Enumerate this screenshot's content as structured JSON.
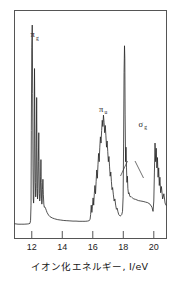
{
  "figure": {
    "xaxis_title": "イオン化エネルギー, I/eV",
    "frame_color": "#555555",
    "trace_color": "#262626"
  },
  "ticks": [
    {
      "label": "12",
      "value": 12
    },
    {
      "label": "14",
      "value": 14
    },
    {
      "label": "16",
      "value": 16
    },
    {
      "label": "18",
      "value": 18
    },
    {
      "label": "20",
      "value": 20
    }
  ],
  "annotations": [
    {
      "base": "π",
      "sub": "g",
      "x": 12.05,
      "y": 0.93
    },
    {
      "base": "π",
      "sub": "u",
      "x": 16.55,
      "y": 0.57
    },
    {
      "base": "σ",
      "sub": "g",
      "x": 19.15,
      "y": 0.5
    }
  ],
  "chart_data": {
    "type": "line",
    "title": "",
    "xlabel": "イオン化エネルギー, I/eV",
    "ylabel": "",
    "xlim": [
      10.9,
      20.8
    ],
    "ylim": [
      0,
      1
    ],
    "grid": false,
    "legend": "none",
    "tick_labels": [
      "12",
      "14",
      "16",
      "18",
      "20"
    ],
    "tick_values": [
      12,
      14,
      16,
      18,
      20
    ],
    "bands": [
      {
        "name": "πg",
        "label": "π_g",
        "onset": 11.95,
        "peak": 12.1,
        "range": [
          11.9,
          13.2
        ]
      },
      {
        "name": "πu",
        "label": "π_u",
        "onset": 15.85,
        "peak": 16.72,
        "range": [
          15.8,
          17.9
        ]
      },
      {
        "name": "σg",
        "label": "σ_g",
        "onset": 18.0,
        "peak": 18.12,
        "range": [
          18.0,
          20.6
        ]
      }
    ],
    "x": [
      10.9,
      11.1,
      11.3,
      11.5,
      11.7,
      11.8,
      11.88,
      11.92,
      11.95,
      11.97,
      12.0,
      12.03,
      12.06,
      12.08,
      12.1,
      12.12,
      12.14,
      12.16,
      12.18,
      12.2,
      12.23,
      12.26,
      12.28,
      12.3,
      12.32,
      12.34,
      12.36,
      12.38,
      12.4,
      12.43,
      12.46,
      12.48,
      12.5,
      12.52,
      12.55,
      12.58,
      12.6,
      12.62,
      12.64,
      12.66,
      12.68,
      12.7,
      12.73,
      12.76,
      12.79,
      12.82,
      12.85,
      12.9,
      12.95,
      13.0,
      13.1,
      13.2,
      13.35,
      13.5,
      13.7,
      13.9,
      14.1,
      14.3,
      14.5,
      14.7,
      14.9,
      15.1,
      15.3,
      15.5,
      15.65,
      15.75,
      15.82,
      15.86,
      15.9,
      15.94,
      15.98,
      16.02,
      16.06,
      16.1,
      16.14,
      16.18,
      16.22,
      16.26,
      16.3,
      16.34,
      16.38,
      16.42,
      16.46,
      16.5,
      16.54,
      16.58,
      16.62,
      16.66,
      16.7,
      16.74,
      16.78,
      16.82,
      16.86,
      16.9,
      16.94,
      16.98,
      17.02,
      17.06,
      17.1,
      17.14,
      17.18,
      17.22,
      17.26,
      17.3,
      17.35,
      17.4,
      17.45,
      17.5,
      17.55,
      17.6,
      17.65,
      17.7,
      17.75,
      17.8,
      17.85,
      17.9,
      17.95,
      17.99,
      18.02,
      18.05,
      18.08,
      18.1,
      18.12,
      18.15,
      18.18,
      18.21,
      18.24,
      18.27,
      18.3,
      18.34,
      18.38,
      18.42,
      18.46,
      18.5,
      18.55,
      18.6,
      18.65,
      18.7,
      18.8,
      18.9,
      19.0,
      19.15,
      19.3,
      19.45,
      19.6,
      19.75,
      19.88,
      19.95,
      20.0,
      20.04,
      20.08,
      20.12,
      20.16,
      20.2,
      20.24,
      20.28,
      20.32,
      20.36,
      20.4,
      20.45,
      20.5,
      20.58,
      20.66,
      20.74,
      20.8
    ],
    "y": [
      0.03,
      0.028,
      0.028,
      0.028,
      0.029,
      0.03,
      0.032,
      0.045,
      0.12,
      0.48,
      0.88,
      0.99,
      0.66,
      0.3,
      0.15,
      0.13,
      0.17,
      0.42,
      0.78,
      0.56,
      0.23,
      0.16,
      0.2,
      0.43,
      0.64,
      0.4,
      0.2,
      0.15,
      0.175,
      0.33,
      0.47,
      0.3,
      0.175,
      0.14,
      0.16,
      0.26,
      0.34,
      0.23,
      0.15,
      0.125,
      0.14,
      0.195,
      0.245,
      0.17,
      0.125,
      0.11,
      0.112,
      0.105,
      0.095,
      0.085,
      0.072,
      0.064,
      0.058,
      0.054,
      0.05,
      0.048,
      0.046,
      0.045,
      0.044,
      0.043,
      0.043,
      0.042,
      0.042,
      0.042,
      0.043,
      0.045,
      0.05,
      0.075,
      0.12,
      0.085,
      0.115,
      0.155,
      0.12,
      0.175,
      0.215,
      0.175,
      0.235,
      0.29,
      0.25,
      0.315,
      0.37,
      0.33,
      0.4,
      0.45,
      0.42,
      0.48,
      0.53,
      0.5,
      0.555,
      0.52,
      0.47,
      0.505,
      0.455,
      0.4,
      0.43,
      0.38,
      0.33,
      0.355,
      0.305,
      0.26,
      0.28,
      0.235,
      0.195,
      0.205,
      0.17,
      0.14,
      0.15,
      0.12,
      0.1,
      0.105,
      0.088,
      0.075,
      0.07,
      0.068,
      0.07,
      0.075,
      0.09,
      0.16,
      0.42,
      0.76,
      0.89,
      0.83,
      0.56,
      0.33,
      0.4,
      0.3,
      0.23,
      0.26,
      0.2,
      0.175,
      0.18,
      0.165,
      0.16,
      0.162,
      0.158,
      0.155,
      0.152,
      0.15,
      0.148,
      0.145,
      0.142,
      0.14,
      0.138,
      0.135,
      0.132,
      0.125,
      0.11,
      0.09,
      0.14,
      0.28,
      0.42,
      0.33,
      0.395,
      0.3,
      0.35,
      0.255,
      0.3,
      0.215,
      0.255,
      0.18,
      0.21,
      0.15,
      0.175,
      0.13,
      0.12,
      0.1,
      0.075,
      0.055
    ]
  }
}
